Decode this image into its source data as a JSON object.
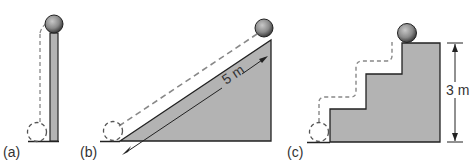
{
  "panels": [
    {
      "id": "a",
      "label": "(a)",
      "path_type": "vertical lift"
    },
    {
      "id": "b",
      "label": "(b)",
      "path_type": "inclined plane",
      "measurement": "5 m"
    },
    {
      "id": "c",
      "label": "(c)",
      "path_type": "stairs",
      "measurement": "3 m"
    }
  ],
  "colors": {
    "fill": "#b3b3b3",
    "stroke": "#222222",
    "dash": "#888888",
    "ball": "#8a8a8a"
  }
}
